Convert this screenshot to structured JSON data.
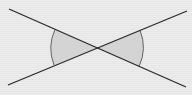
{
  "diagram": {
    "colors": {
      "background": "#ebebeb",
      "line": "#2a2a2a",
      "shade": "#d4d4d4",
      "arc": "#555555"
    },
    "lines": [
      {
        "x1": 9,
        "y1": 9,
        "x2": 186,
        "y2": 87
      },
      {
        "x1": 8,
        "y1": 85,
        "x2": 187,
        "y2": 11
      }
    ],
    "intersection": {
      "x": 97,
      "y": 48
    },
    "angles": [
      {
        "side": "left",
        "shaded": true
      },
      {
        "side": "right",
        "shaded": true
      }
    ]
  }
}
